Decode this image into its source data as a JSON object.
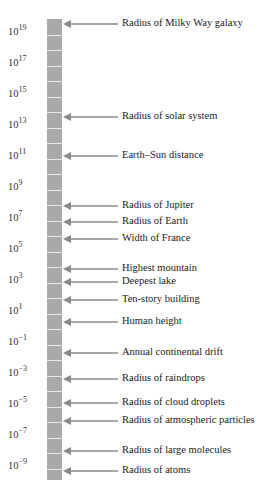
{
  "scale": {
    "title": "",
    "unit": "m",
    "colors": {
      "bar": "#a9a9a9",
      "segment_divider": "#e6e6e6",
      "arrow": "#8a8a8a",
      "text": "#222222"
    },
    "ticks": [
      {
        "base": "10",
        "exp": "19",
        "y": 30
      },
      {
        "base": "10",
        "exp": "17",
        "y": 61
      },
      {
        "base": "10",
        "exp": "15",
        "y": 92
      },
      {
        "base": "10",
        "exp": "13",
        "y": 123
      },
      {
        "base": "10",
        "exp": "11",
        "y": 154
      },
      {
        "base": "10",
        "exp": "9",
        "y": 185
      },
      {
        "base": "10",
        "exp": "7",
        "y": 216
      },
      {
        "base": "10",
        "exp": "5",
        "y": 247
      },
      {
        "base": "10",
        "exp": "3",
        "y": 278
      },
      {
        "base": "10",
        "exp": "1",
        "y": 309
      },
      {
        "base": "10",
        "exp": "−1",
        "y": 340
      },
      {
        "base": "10",
        "exp": "−3",
        "y": 371
      },
      {
        "base": "10",
        "exp": "−5",
        "y": 402
      },
      {
        "base": "10",
        "exp": "−7",
        "y": 433
      },
      {
        "base": "10",
        "exp": "−9",
        "y": 464
      }
    ],
    "items": [
      {
        "label": "Radius of Milky Way galaxy",
        "y": 24
      },
      {
        "label": "Radius of solar system",
        "y": 117
      },
      {
        "label": "Earth–Sun distance",
        "y": 156
      },
      {
        "label": "Radius of Jupiter",
        "y": 206
      },
      {
        "label": "Radius of Earth",
        "y": 222
      },
      {
        "label": "Width of France",
        "y": 239
      },
      {
        "label": "Highest mountain",
        "y": 269
      },
      {
        "label": "Deepest lake",
        "y": 282
      },
      {
        "label": "Ten-story building",
        "y": 300
      },
      {
        "label": "Human height",
        "y": 322
      },
      {
        "label": "Annual continental drift",
        "y": 353
      },
      {
        "label": "Radius of raindrops",
        "y": 379
      },
      {
        "label": "Radius of cloud droplets",
        "y": 403
      },
      {
        "label": "Radius of atmospheric particles",
        "y": 421
      },
      {
        "label": "Radius of large molecules",
        "y": 451
      },
      {
        "label": "Radius of atoms",
        "y": 471
      }
    ]
  }
}
